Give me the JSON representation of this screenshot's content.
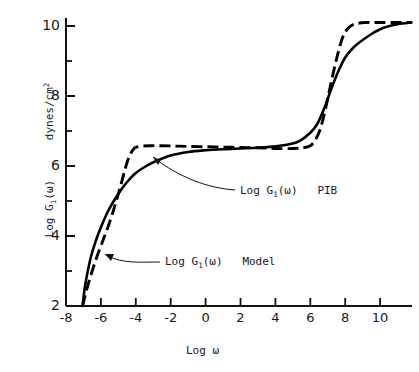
{
  "figure": {
    "background": "#ffffff",
    "ink_color": "#000000"
  },
  "axes": {
    "x_label": "Log ω",
    "y_label_main": "Log G",
    "y_label_sub": "1",
    "y_label_arg": "(ω)",
    "y_label_units_main": "dynes/cm",
    "y_label_units_sup": "2",
    "x_ticks": [
      "-8",
      "-6",
      "-4",
      "-2",
      "0",
      "2",
      "4",
      "6",
      "8",
      "10"
    ],
    "y_ticks": [
      "2",
      "4",
      "6",
      "8",
      "10"
    ]
  },
  "annotations": [
    {
      "name": "pib-annotation",
      "prefix": "Log G",
      "sub": "1",
      "arg": "(ω)",
      "suffix": "PIB"
    },
    {
      "name": "model-annotation",
      "prefix": "Log G",
      "sub": "1",
      "arg": "(ω)",
      "suffix": "Model"
    }
  ],
  "chart_data": {
    "type": "line",
    "title": "",
    "xlabel": "Log ω",
    "ylabel": "Log G1(ω)  dynes/cm^2",
    "xlim": [
      -8,
      11.8
    ],
    "ylim": [
      2,
      10.25
    ],
    "xticks": [
      -8,
      -6,
      -4,
      -2,
      0,
      2,
      4,
      6,
      8,
      10
    ],
    "yticks": [
      2,
      3,
      4,
      5,
      6,
      7,
      8,
      9,
      10
    ],
    "ytick_labels_shown": [
      2,
      4,
      6,
      8,
      10
    ],
    "grid": false,
    "legend": "inline-annotations",
    "series": [
      {
        "name": "Log G1(ω) PIB",
        "style": "solid",
        "x": [
          -7.05,
          -6.9,
          -6.6,
          -6.3,
          -6.0,
          -5.6,
          -5.2,
          -4.8,
          -4.4,
          -4.0,
          -3.4,
          -2.8,
          -2.0,
          -1.0,
          0.0,
          1.0,
          2.0,
          3.0,
          4.0,
          4.8,
          5.4,
          6.0,
          6.4,
          6.8,
          7.2,
          7.6,
          8.0,
          8.5,
          9.0,
          9.6,
          10.2,
          11.0,
          11.8
        ],
        "y": [
          2.0,
          2.6,
          3.35,
          3.85,
          4.25,
          4.7,
          5.05,
          5.35,
          5.6,
          5.8,
          6.0,
          6.15,
          6.3,
          6.4,
          6.45,
          6.48,
          6.5,
          6.52,
          6.56,
          6.62,
          6.72,
          6.95,
          7.2,
          7.65,
          8.2,
          8.7,
          9.1,
          9.4,
          9.6,
          9.8,
          9.95,
          10.05,
          10.1
        ]
      },
      {
        "name": "Log G1(ω) Model",
        "style": "dashed",
        "x": [
          -7.05,
          -6.8,
          -6.5,
          -6.2,
          -5.9,
          -5.6,
          -5.3,
          -5.0,
          -4.7,
          -4.5,
          -4.3,
          -4.1,
          -3.9,
          -3.6,
          -3.2,
          -2.6,
          -1.8,
          -1.0,
          0.0,
          1.0,
          2.0,
          3.0,
          4.0,
          5.0,
          5.6,
          6.0,
          6.3,
          6.6,
          6.9,
          7.2,
          7.5,
          7.8,
          8.1,
          8.5,
          9.2,
          10.0,
          11.0,
          11.8
        ],
        "y": [
          2.0,
          2.5,
          3.0,
          3.45,
          3.85,
          4.25,
          4.7,
          5.2,
          5.75,
          6.1,
          6.35,
          6.5,
          6.55,
          6.57,
          6.58,
          6.58,
          6.57,
          6.56,
          6.55,
          6.54,
          6.53,
          6.52,
          6.5,
          6.5,
          6.52,
          6.58,
          6.75,
          7.1,
          7.7,
          8.4,
          9.05,
          9.6,
          9.9,
          10.05,
          10.1,
          10.1,
          10.1,
          10.1
        ]
      }
    ],
    "plateau_value": 6.5,
    "upper_plateau_value": 10.1,
    "lower_cutoff_x": -7.05
  }
}
